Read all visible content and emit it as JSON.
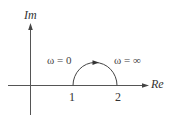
{
  "diagram": {
    "type": "nyquist-plot",
    "axes": {
      "vertical_label": "Im",
      "horizontal_label": "Re"
    },
    "ticks": [
      {
        "label": "1",
        "value": 1
      },
      {
        "label": "2",
        "value": 2
      }
    ],
    "annotations": {
      "start": "ω = 0",
      "end": "ω = ∞"
    },
    "curve": {
      "shape": "semicircle",
      "from": 1,
      "to": 2,
      "direction": "clockwise (left to right, upper half-plane)"
    },
    "colors": {
      "line": "#444444",
      "text": "#333333",
      "background": "#ffffff"
    }
  }
}
